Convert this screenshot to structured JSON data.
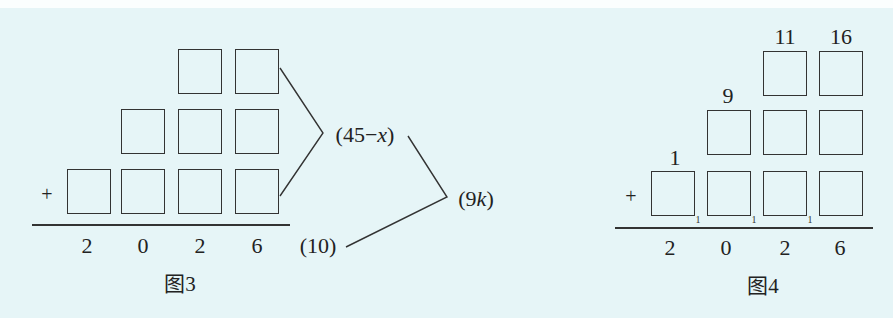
{
  "background_color": "#e6f5f7",
  "figure3": {
    "caption": "图3",
    "plus_sign": "+",
    "sum_digits": [
      "2",
      "0",
      "2",
      "6"
    ],
    "rows": [
      {
        "row": "top",
        "box_count": 2
      },
      {
        "row": "middle",
        "box_count": 3
      },
      {
        "row": "bottom",
        "box_count": 4
      }
    ],
    "annotations": {
      "units_column_sum_prefix": "(45−",
      "units_column_sum_var": "x",
      "units_column_sum_suffix": ")",
      "carry_value": "(10)",
      "difference_prefix": "(9",
      "difference_var": "k",
      "difference_suffix": ")"
    }
  },
  "figure4": {
    "caption": "图4",
    "plus_sign": "+",
    "sum_digits": [
      "2",
      "0",
      "2",
      "6"
    ],
    "column_labels": {
      "thousands": "1",
      "hundreds": "9",
      "tens": "11",
      "units": "16"
    },
    "carry_marks": [
      "1",
      "1",
      "1"
    ],
    "rows": [
      {
        "row": "top",
        "box_count": 2
      },
      {
        "row": "middle",
        "box_count": 3
      },
      {
        "row": "bottom",
        "box_count": 4
      }
    ]
  }
}
